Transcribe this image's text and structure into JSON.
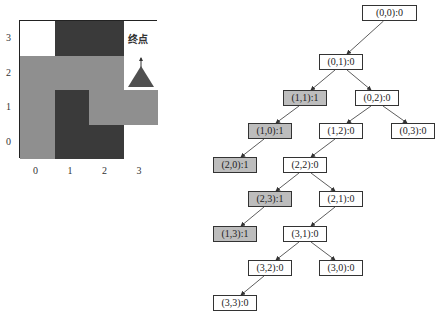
{
  "maze": {
    "rows": 4,
    "cols": 4,
    "x_ticks": [
      "0",
      "1",
      "2",
      "3"
    ],
    "y_ticks": [
      "3",
      "2",
      "1",
      "0"
    ],
    "goal_label": "终点",
    "colors": {
      "wall": "#3a3a3a",
      "path": "#8f8f8f",
      "free": "#ffffff",
      "goal_marker": "#505050"
    },
    "cells": [
      [
        "free",
        "wall",
        "wall",
        "free"
      ],
      [
        "path",
        "path",
        "path",
        "goal"
      ],
      [
        "path",
        "wall",
        "path",
        "path"
      ],
      [
        "path",
        "wall",
        "wall",
        "free"
      ]
    ]
  },
  "tree": {
    "nodes": [
      {
        "id": "n00",
        "label": "(0,0):0",
        "x": 362,
        "y": 5,
        "w": 55,
        "visited": false
      },
      {
        "id": "n01",
        "label": "(0,1):0",
        "x": 319,
        "y": 54,
        "w": 44,
        "visited": false
      },
      {
        "id": "n11",
        "label": "(1,1):1",
        "x": 283,
        "y": 90,
        "w": 44,
        "visited": true
      },
      {
        "id": "n02",
        "label": "(0,2):0",
        "x": 355,
        "y": 90,
        "w": 44,
        "visited": false
      },
      {
        "id": "n10",
        "label": "(1,0):1",
        "x": 248,
        "y": 123,
        "w": 44,
        "visited": true
      },
      {
        "id": "n12",
        "label": "(1,2):0",
        "x": 319,
        "y": 123,
        "w": 44,
        "visited": false
      },
      {
        "id": "n03",
        "label": "(0,3):0",
        "x": 391,
        "y": 123,
        "w": 44,
        "visited": false
      },
      {
        "id": "n20",
        "label": "(2,0):1",
        "x": 213,
        "y": 157,
        "w": 44,
        "visited": true
      },
      {
        "id": "n22",
        "label": "(2,2):0",
        "x": 283,
        "y": 157,
        "w": 44,
        "visited": false
      },
      {
        "id": "n23",
        "label": "(2,3):1",
        "x": 248,
        "y": 191,
        "w": 44,
        "visited": true
      },
      {
        "id": "n21",
        "label": "(2,1):0",
        "x": 319,
        "y": 191,
        "w": 44,
        "visited": false
      },
      {
        "id": "n13",
        "label": "(1,3):1",
        "x": 213,
        "y": 226,
        "w": 44,
        "visited": true
      },
      {
        "id": "n31",
        "label": "(3,1):0",
        "x": 283,
        "y": 226,
        "w": 44,
        "visited": false
      },
      {
        "id": "n32",
        "label": "(3,2):0",
        "x": 248,
        "y": 260,
        "w": 44,
        "visited": false
      },
      {
        "id": "n30",
        "label": "(3,0):0",
        "x": 319,
        "y": 260,
        "w": 44,
        "visited": false
      },
      {
        "id": "n33",
        "label": "(3,3):0",
        "x": 213,
        "y": 295,
        "w": 44,
        "visited": false
      }
    ],
    "edges": [
      [
        "n00",
        "n01"
      ],
      [
        "n01",
        "n11"
      ],
      [
        "n01",
        "n02"
      ],
      [
        "n11",
        "n10"
      ],
      [
        "n02",
        "n12"
      ],
      [
        "n02",
        "n03"
      ],
      [
        "n10",
        "n20"
      ],
      [
        "n12",
        "n22"
      ],
      [
        "n22",
        "n23"
      ],
      [
        "n22",
        "n21"
      ],
      [
        "n23",
        "n13"
      ],
      [
        "n21",
        "n31"
      ],
      [
        "n31",
        "n32"
      ],
      [
        "n31",
        "n30"
      ],
      [
        "n32",
        "n33"
      ]
    ]
  }
}
